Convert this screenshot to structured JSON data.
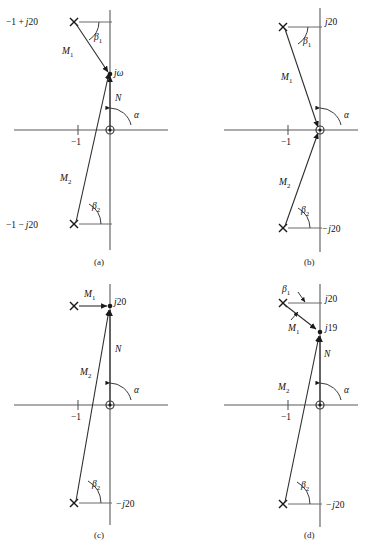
{
  "figure": {
    "type": "root-locus-vector-diagrams",
    "panel_count": 4,
    "panels": [
      {
        "id": "a",
        "caption": "(a)",
        "origin_px": [
          110,
          130
        ],
        "unit_px": 32,
        "real_axis_label": "-1",
        "test_point_label": "jω",
        "test_point_on_axis": true,
        "test_point_y_px": 74,
        "poles": [
          {
            "label": "-1 + j20",
            "x_px": 74,
            "y_px": 22,
            "marker": "x"
          },
          {
            "label": "-1 - j20",
            "x_px": 74,
            "y_px": 224,
            "marker": "x"
          }
        ],
        "vectors": [
          {
            "name": "M₁",
            "label_main": "M",
            "label_sub": "1"
          },
          {
            "name": "M₂",
            "label_main": "M",
            "label_sub": "2"
          },
          {
            "name": "N",
            "label_main": "N",
            "label_sub": ""
          }
        ],
        "angles": [
          {
            "name": "β₁",
            "label_main": "β",
            "label_sub": "1"
          },
          {
            "name": "β₂",
            "label_main": "β",
            "label_sub": "2"
          },
          {
            "name": "α",
            "label_main": "α",
            "label_sub": ""
          }
        ]
      },
      {
        "id": "b",
        "caption": "(b)",
        "origin_px": [
          320,
          130
        ],
        "unit_px": 32,
        "real_axis_label": "-1",
        "test_point_label": "",
        "test_point_on_axis": true,
        "test_point_y_px": 130,
        "poles": [
          {
            "label": "j20",
            "x_px": 283,
            "y_px": 27,
            "marker": "x"
          },
          {
            "label": "-j20",
            "x_px": 283,
            "y_px": 228,
            "marker": "x"
          }
        ],
        "vectors": [
          {
            "name": "M₁",
            "label_main": "M",
            "label_sub": "1"
          },
          {
            "name": "M₂",
            "label_main": "M",
            "label_sub": "2"
          }
        ],
        "angles": [
          {
            "name": "β₁",
            "label_main": "β",
            "label_sub": "1"
          },
          {
            "name": "β₂",
            "label_main": "β",
            "label_sub": "2"
          },
          {
            "name": "α",
            "label_main": "α",
            "label_sub": ""
          }
        ]
      },
      {
        "id": "c",
        "caption": "(c)",
        "origin_px": [
          110,
          405
        ],
        "unit_px": 32,
        "real_axis_label": "-1",
        "test_point_label": "j20",
        "test_point_on_axis": true,
        "test_point_y_px": 306,
        "poles": [
          {
            "label": "",
            "x_px": 74,
            "y_px": 306,
            "marker": "x"
          },
          {
            "label": "-j20",
            "x_px": 74,
            "y_px": 503,
            "marker": "x"
          }
        ],
        "vectors": [
          {
            "name": "M₁",
            "label_main": "M",
            "label_sub": "1"
          },
          {
            "name": "M₂",
            "label_main": "M",
            "label_sub": "2"
          },
          {
            "name": "N",
            "label_main": "N",
            "label_sub": ""
          }
        ],
        "angles": [
          {
            "name": "β₂",
            "label_main": "β",
            "label_sub": "2"
          },
          {
            "name": "α",
            "label_main": "α",
            "label_sub": ""
          }
        ]
      },
      {
        "id": "d",
        "caption": "(d)",
        "origin_px": [
          320,
          405
        ],
        "unit_px": 32,
        "real_axis_label": "-1",
        "test_point_label": "j19",
        "test_point_on_axis": true,
        "test_point_y_px": 332,
        "poles": [
          {
            "label": "j20",
            "x_px": 283,
            "y_px": 303,
            "marker": "x"
          },
          {
            "label": "-j20",
            "x_px": 283,
            "y_px": 504,
            "marker": "x"
          }
        ],
        "vectors": [
          {
            "name": "M₁",
            "label_main": "M",
            "label_sub": "1"
          },
          {
            "name": "M₂",
            "label_main": "M",
            "label_sub": "2"
          },
          {
            "name": "N",
            "label_main": "N",
            "label_sub": ""
          }
        ],
        "angles": [
          {
            "name": "β₁",
            "label_main": "β",
            "label_sub": "1"
          },
          {
            "name": "β₂",
            "label_main": "β",
            "label_sub": "2"
          },
          {
            "name": "α",
            "label_main": "α",
            "label_sub": ""
          }
        ]
      }
    ],
    "text": {
      "a": {
        "pole_upper": "−1 + j20",
        "pole_upper_plain": "−1 +",
        "pole_upper_j": "j",
        "pole_upper_num": "20",
        "pole_lower_plain": "−1 −",
        "pole_lower_j": "j",
        "pole_lower_num": "20",
        "test_point_j": "j",
        "test_point_w": "ω",
        "minus_one": "−1",
        "N": "N",
        "M1": "M",
        "M1sub": "1",
        "M2": "M",
        "M2sub": "2",
        "beta1": "β",
        "beta1sub": "1",
        "beta2": "β",
        "beta2sub": "2",
        "alpha": "α",
        "caption": "(a)"
      },
      "b": {
        "j20": "j",
        "j20num": "20",
        "mj20_minus": "−",
        "mj20_j": "j",
        "mj20num": "20",
        "minus_one": "−1",
        "M1": "M",
        "M1sub": "1",
        "M2": "M",
        "M2sub": "2",
        "beta1": "β",
        "beta1sub": "1",
        "beta2": "β",
        "beta2sub": "2",
        "alpha": "α",
        "caption": "(b)"
      },
      "c": {
        "j20": "j",
        "j20num": "20",
        "mj20_minus": "−",
        "mj20_j": "j",
        "mj20num": "20",
        "minus_one": "−1",
        "N": "N",
        "M1": "M",
        "M1sub": "1",
        "M2": "M",
        "M2sub": "2",
        "beta2": "β",
        "beta2sub": "2",
        "alpha": "α",
        "caption": "(c)"
      },
      "d": {
        "j20": "j",
        "j20num": "20",
        "j19": "j",
        "j19num": "19",
        "mj20_minus": "−",
        "mj20_j": "j",
        "mj20num": "20",
        "minus_one": "−1",
        "N": "N",
        "M1": "M",
        "M1sub": "1",
        "M2": "M",
        "M2sub": "2",
        "beta1": "β",
        "beta1sub": "1",
        "beta2": "β",
        "beta2sub": "2",
        "alpha": "α",
        "caption": "(d)"
      }
    },
    "colors": {
      "background": "#ffffff",
      "axis": "#5a5a5a",
      "vector": "#2e2e2e",
      "text": "#111111"
    }
  }
}
